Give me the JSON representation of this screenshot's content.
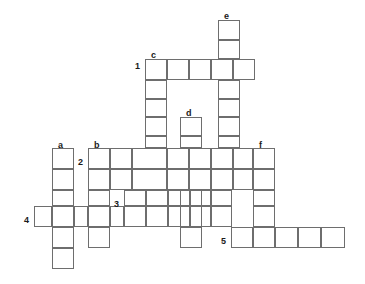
{
  "puzzle": {
    "type": "crossword-grid",
    "title": "",
    "cell_width": 22,
    "cell_height": 21,
    "origin": {
      "x": 34,
      "y": 20
    },
    "stroke_color": "#6e6e6e",
    "background_color": "#ffffff",
    "label_color": "#1a1a1a",
    "across_entries": [
      {
        "number": "1",
        "label_x": 135,
        "label_y": 61,
        "start_col": 5,
        "row": 2,
        "length": 5
      },
      {
        "number": "2",
        "label_x": 78,
        "label_y": 157,
        "start_col": 2.45,
        "row": 6,
        "length": 8.5
      },
      {
        "number": "3",
        "label_x": 114,
        "label_y": 199,
        "start_col": 4.1,
        "row": 8,
        "length": 5
      },
      {
        "number": "4",
        "label_x": 24,
        "label_y": 215,
        "start_col": 0,
        "row": 9,
        "length": 4.1
      },
      {
        "number": "5",
        "label_x": 221,
        "label_y": 236,
        "start_col": 9,
        "row": 10,
        "length": 5.2
      }
    ],
    "down_entries": [
      {
        "letter": "a",
        "label_x": 58,
        "label_y": 140,
        "col": 0.8,
        "start_row": 6,
        "length": 6
      },
      {
        "letter": "b",
        "label_x": 94,
        "label_y": 140,
        "col": 2.45,
        "start_row": 6,
        "length": 5
      },
      {
        "letter": "c",
        "label_x": 151,
        "label_y": 50,
        "col": 5,
        "start_row": 2,
        "length": 6.2
      },
      {
        "letter": "d",
        "label_x": 186,
        "label_y": 108,
        "col": 6.6,
        "start_row": 4.6,
        "length": 5.5
      },
      {
        "letter": "e",
        "label_x": 224,
        "label_y": 11,
        "col": 8.35,
        "start_row": 0,
        "length": 9.1
      },
      {
        "letter": "f",
        "label_x": 259,
        "label_y": 140,
        "col": 9.95,
        "start_row": 6,
        "length": 4
      }
    ],
    "cells": [
      {
        "x": 218,
        "y": 20,
        "w": 22,
        "h": 20,
        "name": "cell-e-1"
      },
      {
        "x": 218,
        "y": 40,
        "w": 22,
        "h": 19,
        "name": "cell-e-2"
      },
      {
        "x": 145,
        "y": 59,
        "w": 22,
        "h": 21,
        "name": "cell-r1-c1"
      },
      {
        "x": 167,
        "y": 59,
        "w": 22,
        "h": 21,
        "name": "cell-r1-c2"
      },
      {
        "x": 189,
        "y": 59,
        "w": 22,
        "h": 21,
        "name": "cell-r1-c3"
      },
      {
        "x": 211,
        "y": 59,
        "w": 22,
        "h": 21,
        "name": "cell-r1-c4"
      },
      {
        "x": 233,
        "y": 59,
        "w": 22,
        "h": 21,
        "name": "cell-r1-c5"
      },
      {
        "x": 145,
        "y": 80,
        "w": 22,
        "h": 19,
        "name": "cell-c-2"
      },
      {
        "x": 218,
        "y": 80,
        "w": 22,
        "h": 19,
        "name": "cell-e-4"
      },
      {
        "x": 145,
        "y": 99,
        "w": 22,
        "h": 18,
        "name": "cell-c-3"
      },
      {
        "x": 218,
        "y": 99,
        "w": 22,
        "h": 18,
        "name": "cell-e-5"
      },
      {
        "x": 145,
        "y": 117,
        "w": 22,
        "h": 19,
        "name": "cell-c-4"
      },
      {
        "x": 180,
        "y": 117,
        "w": 22,
        "h": 19,
        "name": "cell-d-1"
      },
      {
        "x": 218,
        "y": 117,
        "w": 22,
        "h": 19,
        "name": "cell-e-6"
      },
      {
        "x": 145,
        "y": 136,
        "w": 22,
        "h": 12,
        "name": "cell-c-5a"
      },
      {
        "x": 180,
        "y": 136,
        "w": 22,
        "h": 12,
        "name": "cell-d-2a"
      },
      {
        "x": 218,
        "y": 136,
        "w": 22,
        "h": 12,
        "name": "cell-e-7a"
      },
      {
        "x": 88,
        "y": 148,
        "w": 22,
        "h": 21,
        "name": "cell-r2-c1"
      },
      {
        "x": 110,
        "y": 148,
        "w": 22,
        "h": 21,
        "name": "cell-r2-c2"
      },
      {
        "x": 132,
        "y": 148,
        "w": 35,
        "h": 21,
        "name": "cell-r2-c3"
      },
      {
        "x": 167,
        "y": 148,
        "w": 22,
        "h": 21,
        "name": "cell-r2-c4"
      },
      {
        "x": 189,
        "y": 148,
        "w": 22,
        "h": 21,
        "name": "cell-r2-c5"
      },
      {
        "x": 211,
        "y": 148,
        "w": 22,
        "h": 21,
        "name": "cell-r2-c6"
      },
      {
        "x": 233,
        "y": 148,
        "w": 20,
        "h": 21,
        "name": "cell-r2-c7"
      },
      {
        "x": 253,
        "y": 148,
        "w": 22,
        "h": 21,
        "name": "cell-r2-c8"
      },
      {
        "x": 52,
        "y": 148,
        "w": 22,
        "h": 21,
        "name": "cell-a-1"
      },
      {
        "x": 52,
        "y": 169,
        "w": 22,
        "h": 21,
        "name": "cell-a-2"
      },
      {
        "x": 88,
        "y": 169,
        "w": 22,
        "h": 21,
        "name": "cell-b-2"
      },
      {
        "x": 110,
        "y": 169,
        "w": 22,
        "h": 21,
        "name": "cell-b2-x"
      },
      {
        "x": 132,
        "y": 169,
        "w": 35,
        "h": 21,
        "name": "cell-c-6"
      },
      {
        "x": 167,
        "y": 169,
        "w": 22,
        "h": 21,
        "name": "cell-mid-1"
      },
      {
        "x": 189,
        "y": 169,
        "w": 22,
        "h": 21,
        "name": "cell-d-3"
      },
      {
        "x": 211,
        "y": 169,
        "w": 22,
        "h": 21,
        "name": "cell-mid-2"
      },
      {
        "x": 233,
        "y": 169,
        "w": 20,
        "h": 21,
        "name": "cell-e-8"
      },
      {
        "x": 253,
        "y": 169,
        "w": 22,
        "h": 21,
        "name": "cell-f-2"
      },
      {
        "x": 52,
        "y": 190,
        "w": 22,
        "h": 16,
        "name": "cell-a-3"
      },
      {
        "x": 88,
        "y": 190,
        "w": 22,
        "h": 16,
        "name": "cell-b-3"
      },
      {
        "x": 124,
        "y": 190,
        "w": 22,
        "h": 16,
        "name": "cell-r3-c1"
      },
      {
        "x": 146,
        "y": 190,
        "w": 22,
        "h": 16,
        "name": "cell-r3-c2"
      },
      {
        "x": 168,
        "y": 190,
        "w": 22,
        "h": 16,
        "name": "cell-r3-c3"
      },
      {
        "x": 190,
        "y": 190,
        "w": 21,
        "h": 16,
        "name": "cell-r3-c4"
      },
      {
        "x": 211,
        "y": 190,
        "w": 21,
        "h": 16,
        "name": "cell-r3-c5"
      },
      {
        "x": 253,
        "y": 190,
        "w": 22,
        "h": 16,
        "name": "cell-f-3"
      },
      {
        "x": 34,
        "y": 206,
        "w": 18,
        "h": 21,
        "name": "cell-r4-c1"
      },
      {
        "x": 52,
        "y": 206,
        "w": 22,
        "h": 21,
        "name": "cell-r4-c2"
      },
      {
        "x": 74,
        "y": 206,
        "w": 14,
        "h": 21,
        "name": "cell-r4-c3"
      },
      {
        "x": 88,
        "y": 206,
        "w": 22,
        "h": 21,
        "name": "cell-r4-c4"
      },
      {
        "x": 110,
        "y": 206,
        "w": 14,
        "h": 21,
        "name": "cell-r4-c5"
      },
      {
        "x": 124,
        "y": 206,
        "w": 22,
        "h": 21,
        "name": "cell-r3b-1"
      },
      {
        "x": 146,
        "y": 206,
        "w": 22,
        "h": 21,
        "name": "cell-r3b-2"
      },
      {
        "x": 168,
        "y": 206,
        "w": 22,
        "h": 21,
        "name": "cell-r3b-3"
      },
      {
        "x": 190,
        "y": 206,
        "w": 21,
        "h": 21,
        "name": "cell-r3b-4"
      },
      {
        "x": 211,
        "y": 206,
        "w": 21,
        "h": 21,
        "name": "cell-r3b-5"
      },
      {
        "x": 253,
        "y": 206,
        "w": 22,
        "h": 21,
        "name": "cell-f-4"
      },
      {
        "x": 52,
        "y": 227,
        "w": 22,
        "h": 21,
        "name": "cell-a-4"
      },
      {
        "x": 88,
        "y": 227,
        "w": 22,
        "h": 21,
        "name": "cell-b-4"
      },
      {
        "x": 180,
        "y": 227,
        "w": 22,
        "h": 21,
        "name": "cell-d-5"
      },
      {
        "x": 231,
        "y": 227,
        "w": 22,
        "h": 21,
        "name": "cell-r5-c1"
      },
      {
        "x": 253,
        "y": 227,
        "w": 22,
        "h": 21,
        "name": "cell-r5-c2"
      },
      {
        "x": 275,
        "y": 227,
        "w": 23,
        "h": 21,
        "name": "cell-r5-c3"
      },
      {
        "x": 298,
        "y": 227,
        "w": 23,
        "h": 21,
        "name": "cell-r5-c4"
      },
      {
        "x": 321,
        "y": 227,
        "w": 24,
        "h": 21,
        "name": "cell-r5-c5"
      },
      {
        "x": 52,
        "y": 248,
        "w": 22,
        "h": 21,
        "name": "cell-a-5"
      }
    ],
    "extra_cells": [
      {
        "x": 180,
        "y": 190,
        "w": 22,
        "h": 16,
        "name": "cell-d-4"
      },
      {
        "x": 180,
        "y": 206,
        "w": 22,
        "h": 21,
        "name": "cell-d-4b"
      }
    ]
  }
}
